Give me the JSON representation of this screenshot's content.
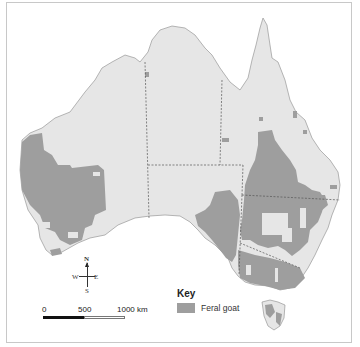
{
  "map": {
    "title": "Distribution of feral goats in Australia",
    "colors": {
      "sea": "#ffffff",
      "land": "#e6e6e6",
      "presence": "#9e9e9e",
      "border": "#666666",
      "frame": "#c8c8c8"
    }
  },
  "compass": {
    "north": "N",
    "south": "S",
    "east": "E",
    "west": "W",
    "icon": "compass-rose-icon"
  },
  "scale_bar": {
    "labels": [
      "0",
      "500",
      "1000 km"
    ]
  },
  "key": {
    "title": "Key",
    "items": [
      {
        "label": "Feral goat",
        "color": "#9e9e9e"
      }
    ]
  }
}
